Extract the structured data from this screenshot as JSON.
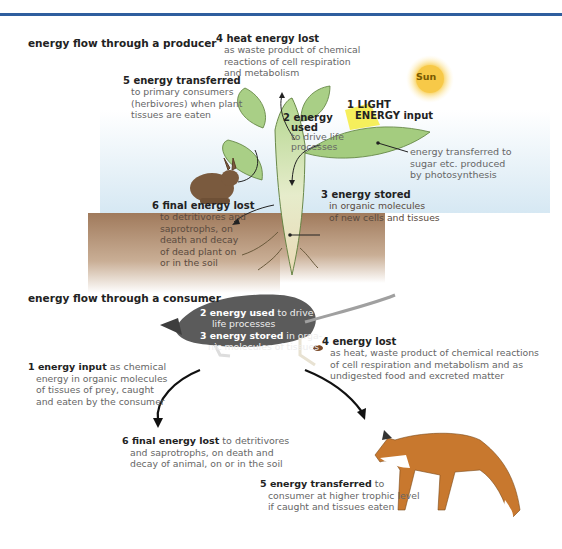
{
  "producer": {
    "title": "energy flow through a producer",
    "sun_label": "Sun",
    "labels": {
      "heat_lost": {
        "head": "4 heat energy lost",
        "desc": [
          "as waste product of chemical",
          "reactions of cell respiration",
          "and metabolism"
        ]
      },
      "transferred": {
        "head": "5 energy transferred",
        "desc": [
          "to primary consumers",
          "(herbivores) when plant",
          "tissues are eaten"
        ]
      },
      "light_input": {
        "head1": "1 LIGHT",
        "head2": "ENERGY input"
      },
      "used": {
        "head1": "2 energy",
        "head2": "used",
        "desc": [
          "to drive life",
          "processes"
        ]
      },
      "sugar": {
        "desc": [
          "energy transferred to",
          "sugar etc. produced",
          "by photosynthesis"
        ]
      },
      "final_lost": {
        "head": "6 final energy lost",
        "desc": [
          "to detritivores and",
          "saprotrophs, on",
          "death and decay",
          "of dead plant on",
          "or in the soil"
        ]
      },
      "stored": {
        "head": "3 energy stored",
        "desc": [
          "in organic molecules",
          "of new cells and tissues"
        ]
      }
    }
  },
  "consumer": {
    "title": "energy flow through a consumer",
    "labels": {
      "used": {
        "bold": "2 energy used",
        "rest": " to drive",
        "line2": "life processes"
      },
      "stored": {
        "bold": "3 energy stored",
        "rest": " in orga-",
        "line2": "nic molecules of tissues"
      },
      "lost": {
        "head": "4 energy lost",
        "desc": [
          "as heat, waste product of chemical reactions",
          "of cell respiration and metabolism and as",
          "undigested food and excreted matter"
        ]
      },
      "input": {
        "bold": "1 energy input",
        "rest": " as chemical",
        "desc": [
          "energy in organic molecules",
          "of tissues of prey, caught",
          "and eaten by the consumer"
        ]
      },
      "final_lost": {
        "bold": "6 final energy lost",
        "rest": " to detritivores",
        "desc": [
          "and saprotrophs, on death and",
          "decay of animal, on or in the soil"
        ]
      },
      "transferred": {
        "bold": "5 energy transferred",
        "rest": " to",
        "desc": [
          "consumer at higher trophic level",
          "if caught and tissues eaten"
        ]
      }
    }
  },
  "colors": {
    "topbar": "#2f5e9e",
    "plant": "#a9cf86",
    "soil": "#a07a5c",
    "sky": "#dcecf6",
    "sun": "#f7c948",
    "rat": "#5a5a5a",
    "fox": "#c8782e",
    "rabbit": "#7a5a3e"
  }
}
